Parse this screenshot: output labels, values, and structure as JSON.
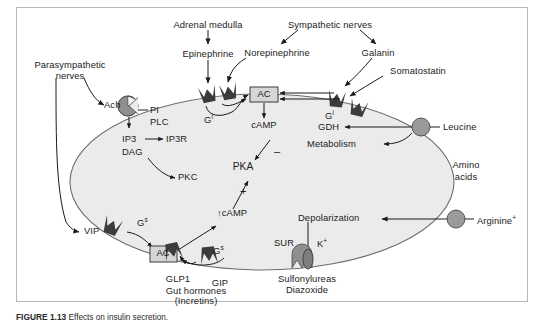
{
  "figure": {
    "panel_bg": "#ffffff",
    "cell_fill": "#ebebeb",
    "cell_stroke": "#6e6e6e",
    "receptor_dark": "#3b3b3b",
    "receptor_gray": "#8f8f8f",
    "box_fill": "#d6d6d6",
    "border_color": "#b9b9b9"
  },
  "labels": {
    "adrenal_medulla": "Adrenal medulla",
    "epinephrine": "Epinephrine",
    "sympathetic_nerves": "Sympathetic nerves",
    "norepinephrine": "Norepinephrine",
    "galanin": "Galanin",
    "somatostatin": "Somatostatin",
    "parasympathetic_nerves_l1": "Parasympathetic",
    "parasympathetic_nerves_l2": "nerves",
    "ach": "Ach",
    "pi": "PI",
    "plc": "PLC",
    "ip3": "IP3",
    "ip3r": "IP3R",
    "dag": "DAG",
    "pkc": "PKC",
    "ac_top": "AC",
    "ac_bottom": "AC",
    "gi_left": "G",
    "gi_left_sup": "i",
    "gi_right": "G",
    "gi_right_sup": "i",
    "gs_left": "G",
    "gs_left_sup": "s",
    "gs_right": "G",
    "gs_right_sup": "s",
    "camp": "cAMP",
    "camp_up": "↑cAMP",
    "pka": "PKA",
    "minus": "–",
    "plus": "+",
    "gdh": "GDH",
    "metabolism": "Metabolism",
    "leucine": "Leucine",
    "amino_l1": "Amino",
    "amino_l2": "acids",
    "depolarization": "Depolarization",
    "arginine": "Arginine",
    "arginine_sup": "+",
    "sur": "SUR",
    "k_ion": "K",
    "k_ion_sup": "+",
    "sulfonylureas": "Sulfonylureas",
    "diazoxide": "Diazoxide",
    "vip": "VIP",
    "glp1": "GLP1",
    "gip": "GIP",
    "gut_hormones": "Gut hormones",
    "incretins": "(Incretins)"
  },
  "caption": {
    "number": "FIGURE 1.13",
    "text": "Effects on insulin secretion."
  },
  "icons": {
    "receptor_crown": "receptor-icon",
    "transporter_circle": "transporter-icon",
    "channel_oval": "channel-icon",
    "pacman_receptor": "ach-receptor-icon"
  }
}
